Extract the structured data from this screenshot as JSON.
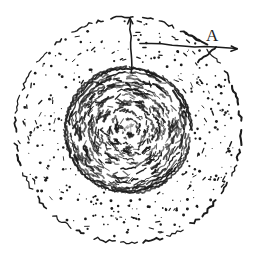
{
  "figure": {
    "type": "hand-drawn-diagram",
    "canvas": {
      "width": 263,
      "height": 265,
      "background": "#ffffff"
    },
    "ink_color": "#1a1a1a",
    "annotations": {
      "label_a": {
        "text": "A",
        "x": 206,
        "y": 27,
        "font_size": 17
      }
    },
    "outer_circle": {
      "name": "dashed-outer-circle",
      "center_x": 128,
      "center_y": 130,
      "radius": 113,
      "style": "dashed",
      "stroke_width": 1.6
    },
    "inner_circle": {
      "name": "inner-textured-disk",
      "center_x": 128,
      "center_y": 130,
      "radius": 62,
      "style": "solid-sketchy",
      "stroke_width": 1.6
    },
    "stipple": {
      "name": "stipple-annulus",
      "inner_radius": 66,
      "outer_radius": 110,
      "dot_count": 330,
      "dot_radius_min": 0.5,
      "dot_radius_max": 1.5
    },
    "swirl_texture": {
      "name": "concentric-swirl-hatching",
      "ring_count": 13,
      "ring_spacing": 4.6,
      "dash_count_per_ring": 34
    },
    "radius_arrow": {
      "name": "vertical-radius-arrow",
      "from_x": 132,
      "from_y": 72,
      "to_x": 130,
      "to_y": 18,
      "arrowhead": "up"
    },
    "leader_line": {
      "name": "leader-line-to-a",
      "from_x": 140,
      "from_y": 43,
      "to_x": 237,
      "to_y": 49,
      "arrowhead": "right"
    },
    "tick_marks": [
      {
        "name": "tick-upper-left",
        "x1": 184,
        "y1": 32,
        "x2": 207,
        "y2": 44
      },
      {
        "name": "tick-lower-right",
        "x1": 198,
        "y1": 62,
        "x2": 216,
        "y2": 47
      }
    ]
  }
}
